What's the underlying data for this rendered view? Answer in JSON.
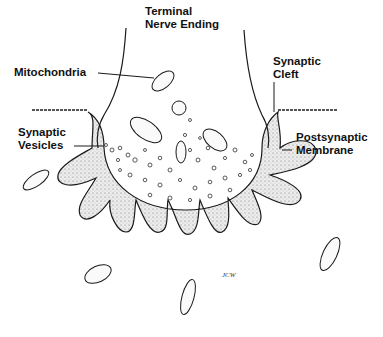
{
  "diagram": {
    "labels": {
      "terminal_line1": "Terminal",
      "terminal_line2": "Nerve Ending",
      "mitochondria": "Mitochondria",
      "cleft_line1": "Synaptic",
      "cleft_line2": "Cleft",
      "vesicles_line1": "Synaptic",
      "vesicles_line2": "Vesicles",
      "post_line1": "Postsynaptic",
      "post_line2": "Membrane",
      "signature": "JCW"
    },
    "colors": {
      "ink": "#1a1a1a",
      "stipple": "#e4e4e4",
      "background": "#ffffff"
    }
  }
}
